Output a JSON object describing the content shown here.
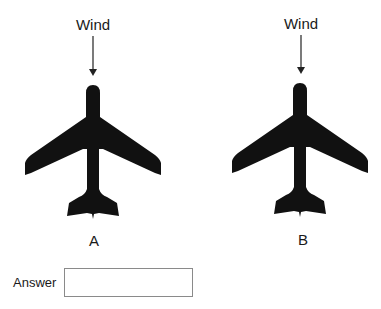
{
  "diagram": {
    "planes": [
      {
        "label": "A",
        "wind_label": "Wind",
        "center_x": 93
      },
      {
        "label": "B",
        "wind_label": "Wind",
        "center_x": 300
      }
    ]
  },
  "answer": {
    "label": "Answer",
    "value": ""
  },
  "colors": {
    "plane": "#111111",
    "arrow": "#222222",
    "box_border": "#8a8a8a"
  }
}
